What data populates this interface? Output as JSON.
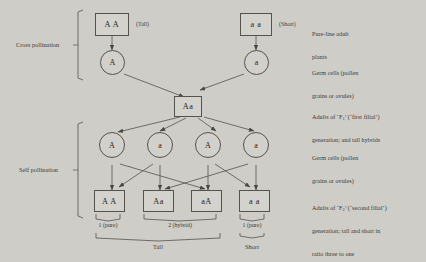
{
  "diagram": {
    "background_color": "#cfcdc8",
    "ink_color": "#56524c"
  },
  "stages": [
    {
      "id": "cross",
      "label": "Cross pollination"
    },
    {
      "id": "self",
      "label": "Self pollination"
    }
  ],
  "parents": [
    {
      "genotype": "A A",
      "phenotype": "(Tall)"
    },
    {
      "genotype": "a a",
      "phenotype": "(Short)"
    }
  ],
  "parent_gametes": [
    {
      "allele": "A"
    },
    {
      "allele": "a"
    }
  ],
  "f1": {
    "genotype": "Aa"
  },
  "f1_gametes": [
    {
      "allele": "A"
    },
    {
      "allele": "a"
    },
    {
      "allele": "A"
    },
    {
      "allele": "a"
    }
  ],
  "f2": [
    {
      "genotype": "A A"
    },
    {
      "genotype": "Aa"
    },
    {
      "genotype": "aA"
    },
    {
      "genotype": "a a"
    }
  ],
  "ratio_labels": [
    {
      "text": "1 (pure)"
    },
    {
      "text": "2 (hybrid)"
    },
    {
      "text": "1 (pure)"
    }
  ],
  "trait_labels": [
    {
      "text": "Tall"
    },
    {
      "text": "Short"
    }
  ],
  "captions": {
    "parents": {
      "line1": "Pure-line adult",
      "line2": "plants"
    },
    "gametes1": {
      "line1": "Germ cells (pollen",
      "line2": "grains or ovules)"
    },
    "f1": {
      "line1_pre": "Adults of ‘F",
      "line1_sub": "1",
      "line1_post": "’ (‘first filial’)",
      "line2": "generation; and tall hybrids"
    },
    "gametes2": {
      "line1": "Germ cells (pollen",
      "line2": "grains or ovules)"
    },
    "f2": {
      "line1_pre": "Adults of ‘F",
      "line1_sub": "2",
      "line1_post": "’ (‘second filial’)",
      "line2": "generation; tall and short in",
      "line3": "ratio three to one"
    }
  }
}
